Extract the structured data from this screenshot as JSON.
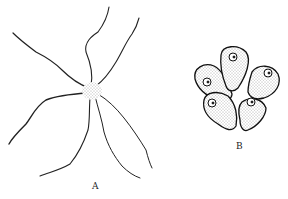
{
  "figure": {
    "panels": [
      {
        "id": "A",
        "label": "A",
        "subject": "cell with long branching processes radiating from a stippled central body"
      },
      {
        "id": "B",
        "label": "B",
        "subject": "cluster of five stippled pear-shaped cells, each with a nucleus"
      }
    ]
  }
}
